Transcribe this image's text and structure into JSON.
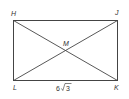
{
  "diagram": {
    "shape": "rectangle",
    "vertices": {
      "top_left": "H",
      "top_right": "J",
      "bottom_right": "K",
      "bottom_left": "L"
    },
    "intersection": "M",
    "diagonals": [
      "HK",
      "JL"
    ],
    "measurements": {
      "LK": {
        "coefficient": "6",
        "radical": "√",
        "radicand": "3"
      }
    },
    "colors": {
      "stroke": "#444444",
      "text": "#333333"
    }
  }
}
